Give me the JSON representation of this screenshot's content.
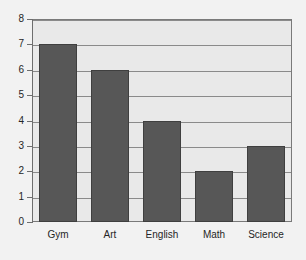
{
  "chart_data": {
    "type": "bar",
    "title": "",
    "subtitle": "",
    "xlabel": "",
    "ylabel": "",
    "categories": [
      "Gym",
      "Art",
      "English",
      "Math",
      "Science"
    ],
    "values": [
      7,
      6,
      4,
      2,
      3
    ],
    "ylim": [
      0,
      8
    ],
    "ytick_labels": [
      "0",
      "1",
      "2",
      "3",
      "4",
      "5",
      "6",
      "7",
      "8"
    ],
    "ytick_values": [
      0,
      1,
      2,
      3,
      4,
      5,
      6,
      7,
      8
    ],
    "grid": true,
    "grid_axis": "y",
    "legend": false,
    "legend_position": "none",
    "annotations": [],
    "colors": {
      "bar_fill": "#575757",
      "bar_edge": "#3f3f3f",
      "plot_background": "#e9e9e9",
      "page_background": "#f2f2f2",
      "gridline": "#8a8a8a",
      "axis": "#6e6e6e",
      "text": "#262626"
    }
  }
}
